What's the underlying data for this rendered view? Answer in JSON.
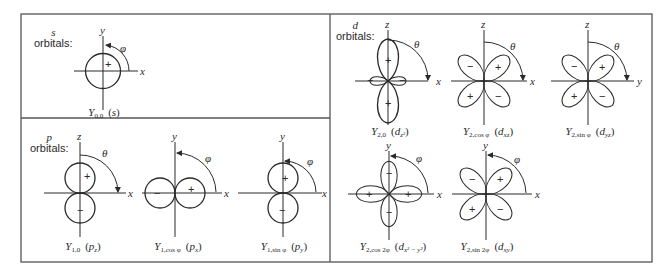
{
  "figure": {
    "panels": {
      "s": {
        "heading": "s",
        "label": "orbitals:"
      },
      "p": {
        "heading": "p",
        "label": "orbitals:"
      },
      "d": {
        "heading": "d",
        "label": "orbitals:"
      }
    },
    "orbitals": [
      {
        "id": "s",
        "Y": "Y",
        "sub": "0,0",
        "name": "s",
        "name_sub": "",
        "axes": [
          "y",
          "x"
        ],
        "angle": "φ",
        "signs": [
          "+"
        ]
      },
      {
        "id": "pz",
        "Y": "Y",
        "sub": "1,0",
        "name": "p",
        "name_sub": "z",
        "axes": [
          "z",
          "x"
        ],
        "angle": "θ",
        "signs": [
          "+",
          "−"
        ]
      },
      {
        "id": "px",
        "Y": "Y",
        "sub": "1,cos φ",
        "name": "p",
        "name_sub": "x",
        "axes": [
          "y",
          "x"
        ],
        "angle": "φ",
        "signs": [
          "−",
          "+"
        ]
      },
      {
        "id": "py",
        "Y": "Y",
        "sub": "1,sin φ",
        "name": "p",
        "name_sub": "y",
        "axes": [
          "y",
          "x"
        ],
        "angle": "φ",
        "signs": [
          "+",
          "−"
        ]
      },
      {
        "id": "dz2",
        "Y": "Y",
        "sub": "2,0",
        "name": "d",
        "name_sub": "z²",
        "axes": [
          "z",
          "x"
        ],
        "angle": "θ",
        "signs": [
          "+",
          "−",
          "−",
          "+"
        ]
      },
      {
        "id": "dxz",
        "Y": "Y",
        "sub": "2,cos φ",
        "name": "d",
        "name_sub": "xz",
        "axes": [
          "z",
          "x"
        ],
        "angle": "θ",
        "signs": [
          "−",
          "+",
          "+",
          "−"
        ]
      },
      {
        "id": "dyz",
        "Y": "Y",
        "sub": "2,sin φ",
        "name": "d",
        "name_sub": "yz",
        "axes": [
          "z",
          "y"
        ],
        "angle": "θ",
        "signs": [
          "−",
          "+",
          "+",
          "−"
        ]
      },
      {
        "id": "dx2y2",
        "Y": "Y",
        "sub": "2,cos 2φ",
        "name": "d",
        "name_sub": "x² − y²",
        "axes": [
          "y",
          "x"
        ],
        "angle": "φ",
        "signs": [
          "−",
          "+",
          "+",
          "−"
        ]
      },
      {
        "id": "dxy",
        "Y": "Y",
        "sub": "2,sin 2φ",
        "name": "d",
        "name_sub": "xy",
        "axes": [
          "y",
          "x"
        ],
        "angle": "φ",
        "signs": [
          "−",
          "+",
          "+",
          "−"
        ]
      }
    ]
  },
  "colors": {
    "ink": "#2a2a2a",
    "border": "#555555",
    "background": "#ffffff"
  }
}
